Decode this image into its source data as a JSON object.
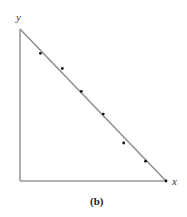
{
  "figure": {
    "caption": "(b)",
    "x_axis_label": "x",
    "y_axis_label": "y"
  },
  "chart_data": {
    "type": "scatter",
    "title": "",
    "caption": "(b)",
    "xlabel": "x",
    "ylabel": "y",
    "grid": false,
    "legend": null,
    "axes_frame": "triangle: y-axis vertical, x-axis horizontal, diagonal line from y-intercept to x-intercept",
    "line": {
      "from": [
        0,
        1
      ],
      "to": [
        1,
        0
      ],
      "description": "straight line x + y = 1 (normalized)"
    },
    "points_normalized": {
      "x": [
        0.14,
        0.29,
        0.42,
        0.57,
        0.71,
        0.86,
        1.0
      ],
      "y": [
        0.84,
        0.74,
        0.59,
        0.44,
        0.25,
        0.13,
        0.0
      ]
    },
    "colors": {
      "axes": "#9a9a9a",
      "line": "#8a8a8a",
      "points": "#111111"
    }
  }
}
